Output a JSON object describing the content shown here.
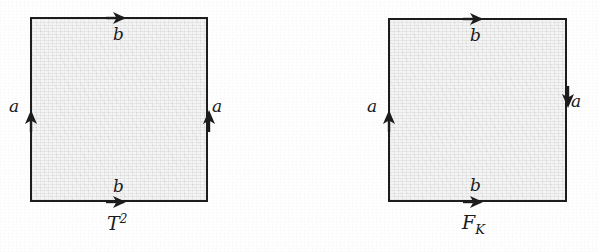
{
  "figure": {
    "kind": "fundamental-polygon-diagram",
    "background_color": "#ffffff",
    "square_fill_color": "#e6e6e6",
    "ink_color": "#1c1c1c",
    "panels": [
      {
        "id": "torus",
        "caption_base": "T",
        "caption_exponent": "2",
        "caption_full": "T²",
        "square": {
          "x": 30,
          "y": 17,
          "width": 178,
          "height": 185
        },
        "edges": [
          {
            "name": "top",
            "label": "b",
            "arrow_direction": "right",
            "label_x": 113,
            "label_y": 26
          },
          {
            "name": "bottom",
            "label": "b",
            "arrow_direction": "right",
            "label_x": 113,
            "label_y": 178
          },
          {
            "name": "left",
            "label": "a",
            "arrow_direction": "up",
            "label_x": 9,
            "label_y": 98
          },
          {
            "name": "right",
            "label": "a",
            "arrow_direction": "up",
            "label_x": 212,
            "label_y": 98
          }
        ]
      },
      {
        "id": "klein-bottle",
        "caption_base": "F",
        "caption_subscript": "K",
        "caption_full": "Fᴋ",
        "square": {
          "x": 388,
          "y": 18,
          "width": 179,
          "height": 184
        },
        "edges": [
          {
            "name": "top",
            "label": "b",
            "arrow_direction": "right",
            "label_x": 470,
            "label_y": 27
          },
          {
            "name": "bottom",
            "label": "b",
            "arrow_direction": "right",
            "label_x": 470,
            "label_y": 177
          },
          {
            "name": "left",
            "label": "a",
            "arrow_direction": "up",
            "label_x": 367,
            "label_y": 98
          },
          {
            "name": "right",
            "label": "a",
            "arrow_direction": "down",
            "label_x": 571,
            "label_y": 93
          }
        ]
      }
    ]
  }
}
